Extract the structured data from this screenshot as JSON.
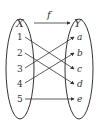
{
  "diagram": {
    "function_label": "f",
    "domain_label": "X",
    "codomain_label": "Y",
    "domain": [
      "1",
      "2",
      "3",
      "4",
      "5"
    ],
    "codomain": [
      "a",
      "b",
      "c",
      "d",
      "e"
    ],
    "mappings": [
      {
        "from": "1",
        "to": "c"
      },
      {
        "from": "2",
        "to": "d"
      },
      {
        "from": "3",
        "to": "a"
      },
      {
        "from": "4",
        "to": "b"
      },
      {
        "from": "5",
        "to": "e"
      }
    ],
    "colors": {
      "stroke": "#333333",
      "background": "#ffffff"
    }
  }
}
